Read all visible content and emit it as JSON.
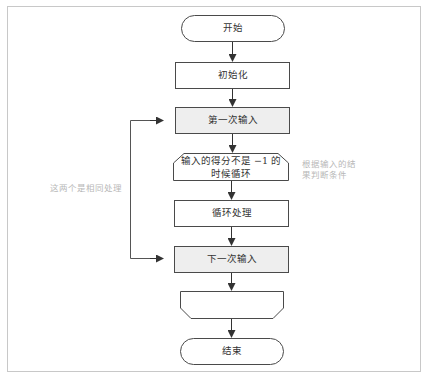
{
  "diagram": {
    "type": "flowchart",
    "colors": {
      "stroke": "#4a4a4a",
      "highlight_fill": "#eeeeee",
      "note_text": "#b8b8b8",
      "frame": "#c8c8c8"
    },
    "nodes": {
      "start": {
        "shape": "terminator",
        "label": "开始"
      },
      "init": {
        "shape": "process",
        "label": "初始化"
      },
      "first_input": {
        "shape": "process-highlighted",
        "label": "第一次输入"
      },
      "loop_start": {
        "shape": "loop-limit-start",
        "label_line1": "输入的得分不是 −1 的",
        "label_line2": "时候循环"
      },
      "loop_body": {
        "shape": "process",
        "label": "循环处理"
      },
      "next_input": {
        "shape": "process-highlighted",
        "label": "下一次输入"
      },
      "loop_end": {
        "shape": "loop-limit-end",
        "label": ""
      },
      "end": {
        "shape": "terminator",
        "label": "结束"
      }
    },
    "annotations": {
      "same_processing": "这两个是相同处理",
      "condition_note_line1": "根据输入的结",
      "condition_note_line2": "果判断条件"
    },
    "edges": [
      [
        "start",
        "init"
      ],
      [
        "init",
        "first_input"
      ],
      [
        "first_input",
        "loop_start"
      ],
      [
        "loop_start",
        "loop_body"
      ],
      [
        "loop_body",
        "next_input"
      ],
      [
        "next_input",
        "loop_end"
      ],
      [
        "loop_end",
        "end"
      ]
    ]
  }
}
